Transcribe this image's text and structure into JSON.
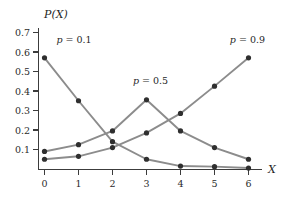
{
  "chart_data": {
    "type": "line",
    "title": "",
    "subtitle": "",
    "xlabel": "X",
    "ylabel": "P(X)",
    "x": [
      0,
      1,
      2,
      3,
      4,
      5,
      6
    ],
    "xtick_labels": [
      "0",
      "1",
      "2",
      "3",
      "4",
      "5",
      "6"
    ],
    "ytick_labels": [
      "0.1",
      "0.2",
      "0.3",
      "0.4",
      "0.5",
      "0.6",
      "0.7"
    ],
    "ytick_values": [
      0.1,
      0.2,
      0.3,
      0.4,
      0.5,
      0.6,
      0.7
    ],
    "xlim": [
      -0.3,
      6.6
    ],
    "ylim": [
      0.0,
      0.78
    ],
    "grid": false,
    "legend_position": "inline-annotations",
    "marker": "filled-circle",
    "series": [
      {
        "name": "p = 0.1",
        "values": [
          0.57,
          0.35,
          0.14,
          0.05,
          0.015,
          0.012,
          0.005
        ],
        "color": "#8c8c8c",
        "annotation": "p = 0.1",
        "annotation_x": 0.35,
        "annotation_y": 0.645
      },
      {
        "name": "p = 0.5",
        "values": [
          0.09,
          0.125,
          0.195,
          0.355,
          0.195,
          0.11,
          0.05
        ],
        "color": "#8c8c8c",
        "annotation": "p = 0.5",
        "annotation_x": 2.6,
        "annotation_y": 0.435
      },
      {
        "name": "p = 0.9",
        "values": [
          0.05,
          0.065,
          0.11,
          0.185,
          0.285,
          0.425,
          0.57
        ],
        "color": "#8c8c8c",
        "annotation": "p = 0.9",
        "annotation_x": 5.45,
        "annotation_y": 0.645
      }
    ],
    "annotations": [
      {
        "text": "p = 0.1",
        "x": 0.35,
        "y": 0.645
      },
      {
        "text": "p = 0.5",
        "x": 2.6,
        "y": 0.435
      },
      {
        "text": "p = 0.9",
        "x": 5.45,
        "y": 0.645
      }
    ],
    "colors": {
      "series": "#8c8c8c",
      "marker": "#2f2f2f",
      "axis": "#3c3c3c",
      "text": "#1f1f1f",
      "background": "#ffffff"
    }
  }
}
